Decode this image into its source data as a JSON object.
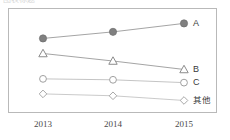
{
  "top_cut_text": "图表标题",
  "chart_data": {
    "type": "line",
    "title": "",
    "subtitle": "",
    "xlabel": "",
    "ylabel": "",
    "categories": [
      "2013",
      "2014",
      "2015"
    ],
    "x_tick_labels": [
      "2013",
      "2014",
      "2015"
    ],
    "ylim": [
      0,
      100
    ],
    "grid": false,
    "legend_position": "right-inline-end-of-line",
    "series": [
      {
        "name": "A",
        "label": "A",
        "marker": "filled-circle",
        "marker_color": "#808080",
        "line_color": "#9a9a9a",
        "values": [
          74,
          81,
          90
        ]
      },
      {
        "name": "B",
        "label": "B",
        "marker": "hollow-triangle",
        "marker_color": "#8c8c8c",
        "line_color": "#9a9a9a",
        "values": [
          58,
          50,
          41
        ]
      },
      {
        "name": "C",
        "label": "C",
        "marker": "hollow-circle",
        "marker_color": "#a0a0a0",
        "line_color": "#bdbdbd",
        "values": [
          31,
          30,
          27
        ]
      },
      {
        "name": "其他",
        "label": "其他",
        "marker": "hollow-diamond",
        "marker_color": "#a8a8a8",
        "line_color": "#c4c4c4",
        "values": [
          15,
          13,
          8
        ]
      }
    ]
  },
  "colors": {
    "frame_border": "#b9b9b9",
    "axis_text": "#4a4a4a",
    "legend_text": "#3a3a3a",
    "background": "#ffffff"
  }
}
